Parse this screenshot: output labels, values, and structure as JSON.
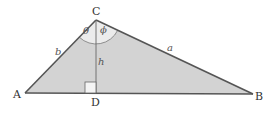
{
  "diagram": {
    "type": "triangle-with-altitude",
    "colors": {
      "fill": "#d3d3d3",
      "angle_fill": "#ececec",
      "stroke": "#555555",
      "label": "#333333",
      "background": "#ffffff"
    },
    "vertices": {
      "A": {
        "label": "A",
        "x": 25,
        "y": 93
      },
      "B": {
        "label": "B",
        "x": 253,
        "y": 94
      },
      "C": {
        "label": "C",
        "x": 96,
        "y": 20
      },
      "D": {
        "label": "D",
        "x": 96,
        "y": 93
      }
    },
    "sides": {
      "a": "a",
      "b": "b",
      "h": "h"
    },
    "angles": {
      "theta": "θ",
      "phi": "ϕ"
    }
  }
}
